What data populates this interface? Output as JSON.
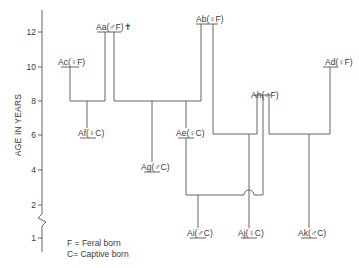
{
  "axis": {
    "title": "AGE IN YEARS",
    "ticks": [
      {
        "label": "12",
        "y": 32
      },
      {
        "label": "10",
        "y": 67
      },
      {
        "label": "8",
        "y": 101
      },
      {
        "label": "6",
        "y": 135
      },
      {
        "label": "4",
        "y": 170
      },
      {
        "label": "2",
        "y": 205
      },
      {
        "label": "1",
        "y": 238
      }
    ],
    "break_symbol": "zigzag"
  },
  "individuals": [
    {
      "id": "Ac",
      "label": "Ac(♀F)",
      "sex": "female",
      "origin": "Feral born"
    },
    {
      "id": "Aa",
      "label": "Aa(♂F)✝",
      "sex": "male",
      "origin": "Feral born",
      "deceased_mark": "✝"
    },
    {
      "id": "Ab",
      "label": "Ab(♀F)",
      "sex": "female",
      "origin": "Feral born"
    },
    {
      "id": "Ad",
      "label": "Ad(♀F)",
      "sex": "female",
      "origin": "Feral born"
    },
    {
      "id": "Ah",
      "label": "Ah(♂F)",
      "sex": "male",
      "origin": "Feral born"
    },
    {
      "id": "Af",
      "label": "Af(♀C)",
      "sex": "female",
      "origin": "Captive born"
    },
    {
      "id": "Ae",
      "label": "Ae(♀C)",
      "sex": "female",
      "origin": "Captive born"
    },
    {
      "id": "Ag",
      "label": "Ag(♂C)",
      "sex": "male",
      "origin": "Captive born"
    },
    {
      "id": "Ai",
      "label": "Ai(♂C)",
      "sex": "male",
      "origin": "Captive born"
    },
    {
      "id": "Aj",
      "label": "Aj(♀C)",
      "sex": "female",
      "origin": "Captive born"
    },
    {
      "id": "Ak",
      "label": "Ak(♂C)",
      "sex": "male",
      "origin": "Captive born"
    }
  ],
  "matings": [
    {
      "parents": [
        "Ac",
        "Aa"
      ],
      "offspring": [
        "Af"
      ]
    },
    {
      "parents": [
        "Aa",
        "Ab"
      ],
      "offspring": [
        "Ag",
        "Ae"
      ]
    },
    {
      "parents": [
        "Ab",
        "Ah"
      ],
      "offspring": [
        "Aj"
      ]
    },
    {
      "parents": [
        "Ae",
        "Ah"
      ],
      "offspring": [
        "Ai"
      ]
    },
    {
      "parents": [
        "Ah",
        "Ad"
      ],
      "offspring": [
        "Ak"
      ]
    }
  ],
  "legend": {
    "line1": "F = Feral born",
    "line2": "C= Captive born"
  }
}
